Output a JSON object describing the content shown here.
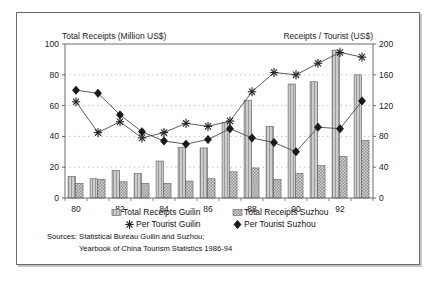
{
  "chart_data": {
    "type": "bar",
    "title": "",
    "categories": [
      "80",
      "81",
      "82",
      "83",
      "84",
      "85",
      "86",
      "87",
      "88",
      "89",
      "90",
      "91",
      "92",
      "93"
    ],
    "tick_labels_shown": [
      "80",
      "82",
      "84",
      "86",
      "88",
      "90",
      "92"
    ],
    "left_axis": {
      "label": "Total Receipts (Million US$)",
      "ticks": [
        0,
        20,
        40,
        60,
        80,
        100
      ],
      "ylim": [
        0,
        100
      ]
    },
    "right_axis": {
      "label": "Receipts / Tourist (US$)",
      "ticks": [
        0,
        40,
        80,
        120,
        160,
        200
      ],
      "ylim": [
        0,
        200
      ]
    },
    "grid": "horizontal dotted gridlines at 20,40,60,80",
    "legend_position": "below-axis",
    "series": [
      {
        "name": "Total Receipts Guilin",
        "type": "bar",
        "axis": "left",
        "pattern": "light-vertical-hatch",
        "values": [
          14,
          12.5,
          18,
          16,
          24,
          33,
          32.5,
          49,
          63.5,
          46.5,
          74,
          75.5,
          96,
          80
        ]
      },
      {
        "name": "Total Receipts Suzhou",
        "type": "bar",
        "axis": "left",
        "pattern": "checker",
        "values": [
          9.5,
          12,
          10.5,
          9.5,
          9.5,
          11,
          12.5,
          17,
          19.5,
          12,
          16,
          21,
          27,
          37.5
        ]
      },
      {
        "name": "Per Tourist Guilin",
        "type": "line",
        "axis": "right",
        "marker": "star",
        "values": [
          125,
          85,
          99,
          78,
          85,
          97,
          93,
          100,
          138,
          163,
          160,
          175,
          189,
          183
        ]
      },
      {
        "name": "Per Tourist Suzhou",
        "type": "line",
        "axis": "right",
        "marker": "diamond",
        "values": [
          140,
          136,
          108,
          86,
          74,
          70,
          76,
          90,
          78,
          72,
          60,
          92,
          90,
          126
        ]
      }
    ]
  },
  "legend": {
    "items": [
      {
        "label": "Total Receipts Guilin",
        "marker": "bar-hatch-icon"
      },
      {
        "label": "Total Receipts Suzhou",
        "marker": "bar-checker-icon"
      },
      {
        "label": "Per Tourist Guilin",
        "marker": "star-icon"
      },
      {
        "label": "Per Tourist Suzhou",
        "marker": "diamond-icon"
      }
    ]
  },
  "sources": {
    "line1": "Sources: Statistical  Bureau Guilin and Suzhou;",
    "line2": "Yearbook of China Tourism Statistics 1986-94"
  },
  "colors": {
    "frame": "#6b6b6b",
    "bar_guilin": "#c9c9c9",
    "bar_suzhou": "#bdbdbd",
    "line": "#4a4a4a",
    "marker_fill": "#1a1a1a",
    "text": "#111111",
    "grid": "#999999"
  }
}
